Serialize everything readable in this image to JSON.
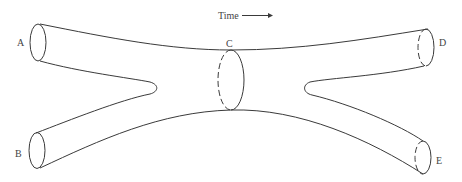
{
  "diagram": {
    "time_label": "Time",
    "time_arrow": "right-arrow",
    "labels": {
      "A": "A",
      "B": "B",
      "C": "C",
      "D": "D",
      "E": "E"
    },
    "line_color": "#3a3a3a",
    "background": "#ffffff"
  }
}
